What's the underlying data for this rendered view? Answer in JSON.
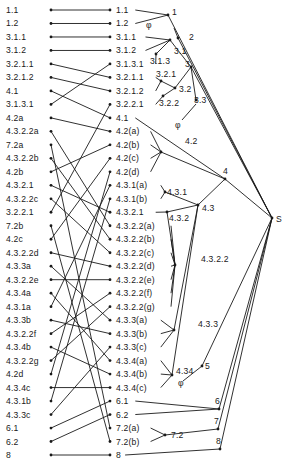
{
  "root_label": "S",
  "empty_symbol": "φ",
  "left_list": [
    "1.1",
    "1.2",
    "3.1.1",
    "3.1.2",
    "3.2.1.1",
    "3.2.1.2",
    "4.1",
    "3.1.3.1",
    "4.2a",
    "4.3.2.2a",
    "7.2a",
    "4.3.2.2b",
    "4.2b",
    "4.3.2.1",
    "4.3.2.2c",
    "3.2.2.1",
    "7.2b",
    "4.2c",
    "4.3.2.2d",
    "4.3.3a",
    "4.3.2.2e",
    "4.3.4a",
    "4.3.1a",
    "4.3.3b",
    "4.3.2.2f",
    "4.3.4b",
    "4.3.2.2g",
    "4.2d",
    "4.3.4c",
    "4.3.1b",
    "4.3.3c",
    "6.1",
    "6.2",
    "8"
  ],
  "right_list": [
    "1.1",
    "1.2",
    "3.1.1",
    "3.1.2",
    "3.1.3.1",
    "3.2.1.1",
    "3.2.1.2",
    "3.2.2.1",
    "4.1",
    "4.2(a)",
    "4.2(b)",
    "4.2(c)",
    "4.2(d)",
    "4.3.1(a)",
    "4.3.1(b)",
    "4.3.2.1",
    "4.3.2.2(a)",
    "4.3.2.2(b)",
    "4.3.2.2(c)",
    "4.3.2.2(d)",
    "4.3.2.2(e)",
    "4.3.2.2(f)",
    "4.3.2.2(g)",
    "4.3.3(a)",
    "4.3.3(b)",
    "4.3.3(c)",
    "4.3.4(a)",
    "4.3.4(b)",
    "4.3.4(c)",
    "6.1",
    "6.2",
    "7.2(a)",
    "7.2(b)",
    "8"
  ],
  "matches": [
    [
      0,
      0
    ],
    [
      1,
      1
    ],
    [
      2,
      2
    ],
    [
      3,
      3
    ],
    [
      4,
      5
    ],
    [
      5,
      6
    ],
    [
      6,
      8
    ],
    [
      7,
      4
    ],
    [
      8,
      9
    ],
    [
      9,
      16
    ],
    [
      10,
      31
    ],
    [
      11,
      17
    ],
    [
      12,
      10
    ],
    [
      13,
      15
    ],
    [
      14,
      18
    ],
    [
      15,
      7
    ],
    [
      16,
      32
    ],
    [
      17,
      11
    ],
    [
      18,
      19
    ],
    [
      19,
      23
    ],
    [
      20,
      20
    ],
    [
      21,
      26
    ],
    [
      22,
      13
    ],
    [
      23,
      24
    ],
    [
      24,
      21
    ],
    [
      25,
      27
    ],
    [
      26,
      22
    ],
    [
      27,
      12
    ],
    [
      28,
      28
    ],
    [
      29,
      14
    ],
    [
      30,
      25
    ],
    [
      31,
      29
    ],
    [
      32,
      30
    ],
    [
      33,
      33
    ]
  ],
  "tree_nodes": [
    {
      "id": "1",
      "label": "1",
      "children_right": [
        0,
        1
      ],
      "parent": "S"
    },
    {
      "id": "2",
      "label": "2",
      "children_right": [],
      "parent": "S",
      "empty": true
    },
    {
      "id": "3.1.3",
      "label": "3.1.3",
      "children_right": [
        4
      ],
      "parent": "3.1"
    },
    {
      "id": "3.1",
      "label": "3.1",
      "children_right": [
        2,
        3
      ],
      "parent": "3"
    },
    {
      "id": "3.2.1",
      "label": "3.2.1",
      "children_right": [
        5,
        6
      ],
      "parent": "3.2"
    },
    {
      "id": "3.2.2",
      "label": "3.2.2",
      "children_right": [
        7
      ],
      "parent": "3.2"
    },
    {
      "id": "3.2",
      "label": "3.2",
      "children_right": [],
      "parent": "3"
    },
    {
      "id": "3.3",
      "label": "3.3",
      "children_right": [],
      "parent": "3",
      "empty": true
    },
    {
      "id": "3",
      "label": "3",
      "children_right": [],
      "parent": "S"
    },
    {
      "id": "4.2",
      "label": "4.2",
      "children_right": [
        9,
        10,
        11,
        12
      ],
      "parent": "4"
    },
    {
      "id": "4.3.1",
      "label": "4.3.1",
      "children_right": [
        13,
        14
      ],
      "parent": "4.3"
    },
    {
      "id": "4.3.2.2",
      "label": "4.3.2.2",
      "children_right": [
        16,
        17,
        18,
        19,
        20,
        21,
        22
      ],
      "parent": "4.3.2"
    },
    {
      "id": "4.3.2",
      "label": "4.3.2",
      "children_right": [
        15
      ],
      "parent": "4.3"
    },
    {
      "id": "4.3.3",
      "label": "4.3.3",
      "children_right": [
        23,
        24,
        25
      ],
      "parent": "4.3"
    },
    {
      "id": "4.3.4",
      "label": "4.34",
      "children_right": [
        26,
        27,
        28
      ],
      "parent": "4.3"
    },
    {
      "id": "4.3",
      "label": "4.3",
      "children_right": [],
      "parent": "4"
    },
    {
      "id": "4",
      "label": "4",
      "children_right": [
        8
      ],
      "parent": "S"
    },
    {
      "id": "5",
      "label": "5",
      "children_right": [],
      "parent": "S",
      "empty": true
    },
    {
      "id": "6",
      "label": "6",
      "children_right": [
        29,
        30
      ],
      "parent": "S"
    },
    {
      "id": "7.2",
      "label": "7.2",
      "children_right": [
        31,
        32
      ],
      "parent": "7"
    },
    {
      "id": "7",
      "label": "7",
      "children_right": [],
      "parent": "S"
    },
    {
      "id": "8n",
      "label": "8",
      "children_right": [
        33
      ],
      "parent": "S"
    }
  ]
}
